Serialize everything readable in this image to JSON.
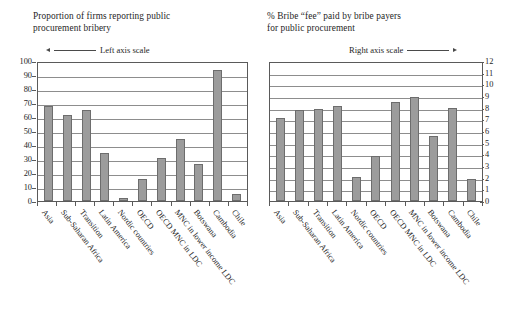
{
  "chart_data": [
    {
      "type": "bar",
      "panel": "left",
      "title": "Proportion of firms reporting public\nprocurement bribery",
      "axis_note": "Left axis scale",
      "axis_arrow": "arrow-left",
      "axis_side": "left",
      "xlabel": "",
      "ylabel": "",
      "ylim": [
        0,
        100
      ],
      "yticks": [
        0,
        10,
        20,
        30,
        40,
        50,
        60,
        70,
        80,
        90,
        100
      ],
      "ytick_labels": [
        "0",
        "10",
        "20",
        "30",
        "40",
        "50",
        "60",
        "70",
        "80",
        "90",
        "100"
      ],
      "grid": true,
      "categories": [
        "Asia",
        "Sub-Saharan Africa",
        "Transition",
        "Latin America",
        "Nordic countries",
        "OECD",
        "OECD MNC in LDC",
        "MNC in lower income LDC",
        "Botswana",
        "Cambodia",
        "Chile"
      ],
      "values": [
        68,
        61.5,
        65,
        34,
        2.5,
        15.5,
        31,
        44.5,
        26.5,
        93.5,
        5
      ]
    },
    {
      "type": "bar",
      "panel": "right",
      "title": "% Bribe “fee” paid by bribe payers\nfor public procurement",
      "axis_note": "Right axis scale",
      "axis_arrow": "arrow-right",
      "axis_side": "right",
      "xlabel": "",
      "ylabel": "",
      "ylim": [
        0,
        12
      ],
      "yticks": [
        0,
        1,
        2,
        3,
        4,
        5,
        6,
        7,
        8,
        9,
        10,
        11,
        12
      ],
      "ytick_labels": [
        "0",
        "1",
        "2",
        "3",
        "4",
        "5",
        "6",
        "7",
        "8",
        "9",
        "10",
        "11",
        "12"
      ],
      "grid": true,
      "categories": [
        "Asia",
        "Sub-Saharan Africa",
        "Transition",
        "Latin America",
        "Nordic countries",
        "OECD",
        "OECD MNC in LDC",
        "MNC in lower income LDC",
        "Botswana",
        "Cambodia",
        "Chile"
      ],
      "values": [
        7.1,
        7.8,
        7.85,
        8.15,
        2.1,
        3.85,
        8.5,
        8.95,
        5.6,
        8.0,
        1.85
      ]
    }
  ],
  "style": {
    "bar_fill": "#9c9c9c",
    "bar_stroke": "#6d6d6d",
    "grid_color": "#8d8d8d",
    "frame_color": "#5a5a5a",
    "text_color": "#262626",
    "background": "#ffffff"
  }
}
